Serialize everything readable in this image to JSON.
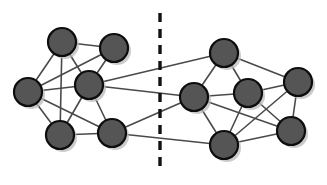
{
  "figure": {
    "background_color": "#ffffff",
    "width": 327,
    "height": 185
  },
  "style": {
    "node_fill": "#555555",
    "node_stroke": "#0d0d0d",
    "node_radius": 14,
    "node_stroke_width": 2.2,
    "edge_color": "#4a4a4a",
    "edge_width": 1.6,
    "shadow_color": "#b9b9b9",
    "shadow_offset_x": 3,
    "shadow_offset_y": 3,
    "partition_color": "#111111",
    "partition_width": 3.4,
    "partition_dash": "9 7"
  },
  "chart_data": {
    "type": "diagram",
    "subtype": "node-link-graph",
    "node_count": 12,
    "edge_count": 28,
    "cluster_count": 2,
    "clusters": [
      {
        "name": "left-cluster",
        "node_ids": [
          "L1",
          "L2",
          "L3",
          "L4",
          "L5",
          "L6"
        ]
      },
      {
        "name": "right-cluster",
        "node_ids": [
          "R1",
          "R2",
          "R3",
          "R4",
          "R5",
          "R6"
        ]
      }
    ],
    "nodes": [
      {
        "id": "L1",
        "label": "",
        "x": 62,
        "y": 42,
        "r": 14,
        "cluster": "left-cluster"
      },
      {
        "id": "L2",
        "label": "",
        "x": 114,
        "y": 48,
        "r": 14,
        "cluster": "left-cluster"
      },
      {
        "id": "L3",
        "label": "",
        "x": 28,
        "y": 92,
        "r": 14,
        "cluster": "left-cluster"
      },
      {
        "id": "L4",
        "label": "",
        "x": 89,
        "y": 85,
        "r": 14,
        "cluster": "left-cluster"
      },
      {
        "id": "L5",
        "label": "",
        "x": 60,
        "y": 135,
        "r": 14,
        "cluster": "left-cluster"
      },
      {
        "id": "L6",
        "label": "",
        "x": 112,
        "y": 133,
        "r": 14,
        "cluster": "left-cluster"
      },
      {
        "id": "R1",
        "label": "",
        "x": 224,
        "y": 53,
        "r": 14,
        "cluster": "right-cluster"
      },
      {
        "id": "R2",
        "label": "",
        "x": 194,
        "y": 97,
        "r": 14,
        "cluster": "right-cluster"
      },
      {
        "id": "R3",
        "label": "",
        "x": 248,
        "y": 93,
        "r": 14,
        "cluster": "right-cluster"
      },
      {
        "id": "R4",
        "label": "",
        "x": 298,
        "y": 82,
        "r": 14,
        "cluster": "right-cluster"
      },
      {
        "id": "R5",
        "label": "",
        "x": 224,
        "y": 145,
        "r": 14,
        "cluster": "right-cluster"
      },
      {
        "id": "R6",
        "label": "",
        "x": 291,
        "y": 131,
        "r": 14,
        "cluster": "right-cluster"
      }
    ],
    "edges": [
      {
        "source": "L1",
        "target": "L3",
        "type": "intra"
      },
      {
        "source": "L1",
        "target": "L4",
        "type": "intra"
      },
      {
        "source": "L1",
        "target": "L5",
        "type": "intra"
      },
      {
        "source": "L1",
        "target": "L2",
        "type": "intra"
      },
      {
        "source": "L2",
        "target": "L4",
        "type": "intra"
      },
      {
        "source": "L2",
        "target": "L3",
        "type": "intra"
      },
      {
        "source": "L3",
        "target": "L4",
        "type": "intra"
      },
      {
        "source": "L3",
        "target": "L5",
        "type": "intra"
      },
      {
        "source": "L3",
        "target": "L6",
        "type": "intra"
      },
      {
        "source": "L4",
        "target": "L5",
        "type": "intra"
      },
      {
        "source": "L4",
        "target": "L6",
        "type": "intra"
      },
      {
        "source": "L5",
        "target": "L6",
        "type": "intra"
      },
      {
        "source": "L4",
        "target": "R1",
        "type": "cut"
      },
      {
        "source": "L4",
        "target": "R2",
        "type": "cut"
      },
      {
        "source": "L6",
        "target": "R2",
        "type": "cut"
      },
      {
        "source": "L6",
        "target": "R5",
        "type": "cut"
      },
      {
        "source": "R1",
        "target": "R2",
        "type": "intra"
      },
      {
        "source": "R1",
        "target": "R3",
        "type": "intra"
      },
      {
        "source": "R1",
        "target": "R4",
        "type": "intra"
      },
      {
        "source": "R2",
        "target": "R3",
        "type": "intra"
      },
      {
        "source": "R2",
        "target": "R5",
        "type": "intra"
      },
      {
        "source": "R2",
        "target": "R6",
        "type": "intra"
      },
      {
        "source": "R3",
        "target": "R4",
        "type": "intra"
      },
      {
        "source": "R3",
        "target": "R5",
        "type": "intra"
      },
      {
        "source": "R3",
        "target": "R6",
        "type": "intra"
      },
      {
        "source": "R4",
        "target": "R5",
        "type": "intra"
      },
      {
        "source": "R4",
        "target": "R6",
        "type": "intra"
      },
      {
        "source": "R5",
        "target": "R6",
        "type": "intra"
      }
    ],
    "partition": {
      "id": "cut-line",
      "orientation": "vertical",
      "style": "dashed",
      "x": 160,
      "y1": 13,
      "y2": 170
    }
  }
}
